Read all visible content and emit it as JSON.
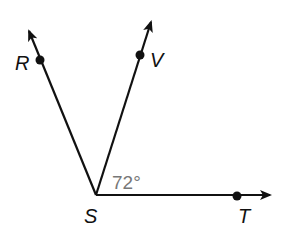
{
  "diagram": {
    "type": "geometry-angle",
    "vertex": {
      "label": "S",
      "x": 96,
      "y": 195
    },
    "rays": [
      {
        "name": "SR",
        "point_label": "R",
        "point": [
          40,
          60
        ],
        "tip": [
          27,
          27
        ],
        "label_pos": [
          15,
          70
        ]
      },
      {
        "name": "SV",
        "point_label": "V",
        "point": [
          140,
          55
        ],
        "tip": [
          152,
          18
        ],
        "label_pos": [
          150,
          67
        ]
      },
      {
        "name": "ST",
        "point_label": "T",
        "point": [
          237,
          196
        ],
        "tip": [
          273,
          196
        ],
        "label_pos": [
          238,
          223
        ]
      }
    ],
    "angle_annotation": {
      "between": [
        "SV",
        "ST"
      ],
      "text": "72°",
      "pos": [
        113,
        189
      ]
    },
    "colors": {
      "line": "#111111",
      "angle_text": "#777777",
      "background": "#ffffff"
    }
  },
  "labels": {
    "R": "R",
    "V": "V",
    "S": "S",
    "T": "T",
    "angle": "72°"
  }
}
